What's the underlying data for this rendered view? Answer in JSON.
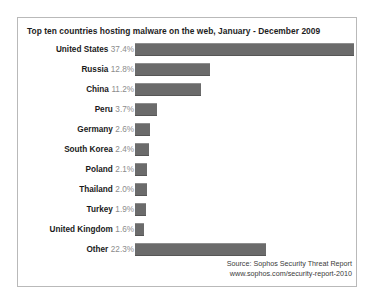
{
  "chart_data": {
    "type": "bar",
    "title": "Top ten countries hosting malware on the web, January - December 2009",
    "xlabel": "",
    "ylabel": "",
    "orientation": "horizontal",
    "grid": false,
    "legend": "none",
    "xlim": [
      0,
      37.4
    ],
    "value_suffix": "%",
    "categories": [
      "United States",
      "Russia",
      "China",
      "Peru",
      "Germany",
      "South Korea",
      "Poland",
      "Thailand",
      "Turkey",
      "United Kingdom",
      "Other"
    ],
    "values": [
      37.4,
      12.8,
      11.2,
      3.7,
      2.6,
      2.4,
      2.1,
      2.0,
      1.9,
      1.6,
      22.3
    ],
    "value_labels": [
      "37.4%",
      "12.8%",
      "11.2%",
      "3.7%",
      "2.6%",
      "2.4%",
      "2.1%",
      "2.0%",
      "1.9%",
      "1.6%",
      "22.3%"
    ],
    "bar_color": "#6b6b6b",
    "panel_border_color": "#b9b9b9",
    "background_color": "#ffffff"
  },
  "source": {
    "line1": "Source: Sophos Security Threat Report",
    "line2": "www.sophos.com/security-report-2010"
  }
}
